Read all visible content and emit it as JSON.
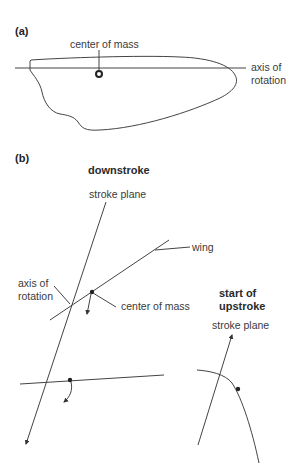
{
  "panel_a": {
    "label": "(a)",
    "center_of_mass_label": "center of mass",
    "axis_label_line1": "axis of",
    "axis_label_line2": "rotation"
  },
  "panel_b": {
    "label": "(b)",
    "downstroke": {
      "title": "downstroke",
      "stroke_plane_label": "stroke plane",
      "wing_label": "wing",
      "axis_label_line1": "axis of",
      "axis_label_line2": "rotation",
      "center_of_mass_label": "center of mass"
    },
    "upstroke": {
      "title_line1": "start of",
      "title_line2": "upstroke",
      "stroke_plane_label": "stroke plane"
    }
  },
  "colors": {
    "line": "#444444",
    "text": "#3a3a3a",
    "background": "#ffffff"
  }
}
